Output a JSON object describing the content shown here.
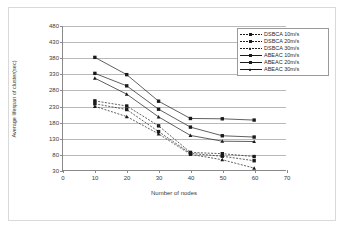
{
  "chart_data": {
    "type": "line",
    "title": "",
    "xlabel": "Number of nodes",
    "ylabel": "Average lifespan of cluster(sec)",
    "x": [
      10,
      20,
      30,
      40,
      50,
      60
    ],
    "xlim": [
      0,
      70
    ],
    "ylim": [
      30,
      480
    ],
    "xticks": [
      0,
      10,
      20,
      30,
      40,
      50,
      60,
      70
    ],
    "yticks": [
      30,
      80,
      130,
      180,
      230,
      280,
      330,
      380,
      430,
      480
    ],
    "grid": "horizontal",
    "legend_position": "top-right",
    "series": [
      {
        "name": "DSBCA 10m/s",
        "style": "dashed",
        "marker": "square",
        "values": [
          246,
          230,
          168,
          85,
          81,
          72
        ]
      },
      {
        "name": "DSBCA 20m/s",
        "style": "dashed",
        "marker": "square",
        "values": [
          237,
          219,
          150,
          82,
          73,
          59
        ]
      },
      {
        "name": "DSBCA 30m/s",
        "style": "dashed",
        "marker": "triangle",
        "values": [
          229,
          197,
          143,
          79,
          62,
          36
        ]
      },
      {
        "name": "ABEAC 10m/s",
        "style": "solid",
        "marker": "square",
        "values": [
          382,
          328,
          245,
          191,
          190,
          186
        ]
      },
      {
        "name": "ABEAC 20m/s",
        "style": "solid",
        "marker": "square",
        "values": [
          332,
          293,
          220,
          164,
          137,
          133
        ]
      },
      {
        "name": "ABEAC 30m/s",
        "style": "solid",
        "marker": "triangle",
        "values": [
          317,
          267,
          196,
          138,
          120,
          119
        ]
      }
    ],
    "colors": {
      "line": "#1a1a1a",
      "grid": "#b9b9b9",
      "axis": "#8a8a8a",
      "background": "#ffffff"
    }
  }
}
